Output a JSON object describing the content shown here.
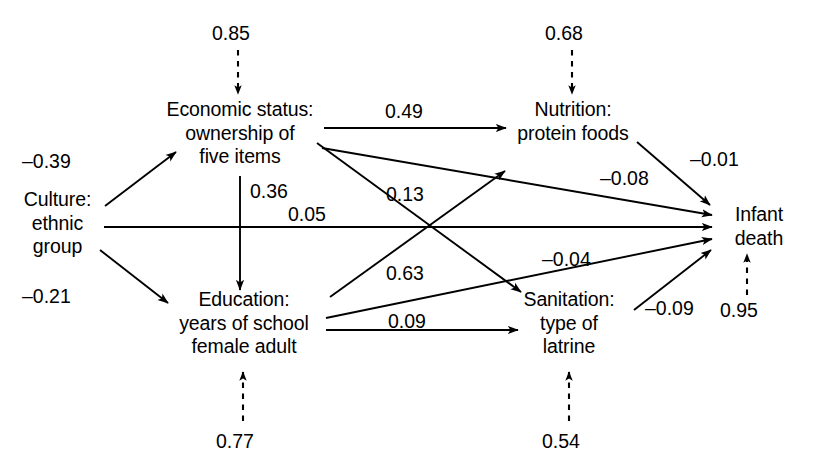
{
  "diagram": {
    "type": "path-diagram",
    "title": "",
    "background_color": "#ffffff",
    "stroke_color": "#000000",
    "nodes": [
      {
        "id": "culture",
        "lines": [
          "Culture:",
          "ethnic",
          "group"
        ]
      },
      {
        "id": "economic",
        "lines": [
          "Economic status:",
          "ownership of",
          "five items"
        ]
      },
      {
        "id": "education",
        "lines": [
          "Education:",
          "years of school",
          "female adult"
        ]
      },
      {
        "id": "nutrition",
        "lines": [
          "Nutrition:",
          "protein foods"
        ]
      },
      {
        "id": "sanitation",
        "lines": [
          "Sanitation:",
          "type of",
          "latrine"
        ]
      },
      {
        "id": "infant",
        "lines": [
          "Infant",
          "death"
        ]
      }
    ],
    "coefficients": [
      {
        "id": "c-085",
        "value": "0.85",
        "from": "disturbance",
        "to": "economic",
        "style": "dashed"
      },
      {
        "id": "c-068",
        "value": "0.68",
        "from": "disturbance",
        "to": "nutrition",
        "style": "dashed"
      },
      {
        "id": "c-077",
        "value": "0.77",
        "from": "disturbance",
        "to": "education",
        "style": "dashed"
      },
      {
        "id": "c-054",
        "value": "0.54",
        "from": "disturbance",
        "to": "sanitation",
        "style": "dashed"
      },
      {
        "id": "c-095",
        "value": "0.95",
        "from": "disturbance",
        "to": "infant",
        "style": "dashed"
      },
      {
        "id": "c-m039",
        "value": "–0.39",
        "from": "culture",
        "to": "economic",
        "style": "solid"
      },
      {
        "id": "c-m021",
        "value": "–0.21",
        "from": "culture",
        "to": "education",
        "style": "solid"
      },
      {
        "id": "c-036",
        "value": "0.36",
        "from": "economic",
        "to": "education",
        "style": "solid"
      },
      {
        "id": "c-049",
        "value": "0.49",
        "from": "economic",
        "to": "nutrition",
        "style": "solid"
      },
      {
        "id": "c-013",
        "value": "0.13",
        "from": "economic",
        "to": "sanitation",
        "style": "solid"
      },
      {
        "id": "c-m008",
        "value": "–0.08",
        "from": "economic",
        "to": "infant",
        "style": "solid"
      },
      {
        "id": "c-005",
        "value": "0.05",
        "from": "culture",
        "to": "infant",
        "style": "solid"
      },
      {
        "id": "c-063",
        "value": "0.63",
        "from": "education",
        "to": "nutrition",
        "style": "solid"
      },
      {
        "id": "c-009",
        "value": "0.09",
        "from": "education",
        "to": "sanitation",
        "style": "solid"
      },
      {
        "id": "c-m004",
        "value": "–0.04",
        "from": "education",
        "to": "infant",
        "style": "solid"
      },
      {
        "id": "c-m001",
        "value": "–0.01",
        "from": "nutrition",
        "to": "infant",
        "style": "solid"
      },
      {
        "id": "c-m009",
        "value": "–0.09",
        "from": "sanitation",
        "to": "infant",
        "style": "solid"
      }
    ]
  }
}
